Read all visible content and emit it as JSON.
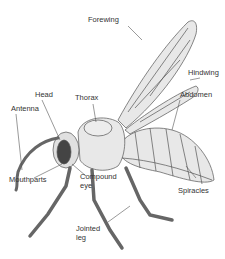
{
  "diagram": {
    "labels": {
      "forewing": "Forewing",
      "hindwing": "Hindwing",
      "thorax": "Thorax",
      "head": "Head",
      "abdomen": "Abdomen",
      "antenna": "Antenna",
      "mouthparts": "Mouthparts",
      "compound_eye": "Compound eye",
      "spiracles": "Spiracles",
      "jointed_leg": "Jointed leg"
    },
    "colors": {
      "body_fill": "#e6e6e6",
      "outline": "#555555",
      "leg_fill": "#8a8a8a",
      "eye_fill": "#444444",
      "leader_line": "#555555"
    }
  }
}
